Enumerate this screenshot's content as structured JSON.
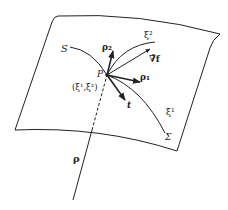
{
  "diagram": {
    "type": "surface-coordinate-diagram",
    "labels": {
      "curve_S": "S",
      "point_P": "P",
      "coords": "(ξ¹,ξ²)",
      "xi1": "ξ¹",
      "xi2": "ξ²",
      "rho1": "ρ₁",
      "rho2": "ρ₂",
      "grad_f": "∇̃f",
      "t": "t",
      "surface": "Σ",
      "rho": "ρ"
    },
    "colors": {
      "stroke": "#222222",
      "background": "#ffffff"
    }
  }
}
